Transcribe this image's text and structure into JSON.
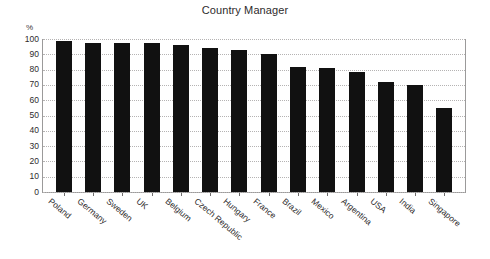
{
  "chart_data": {
    "type": "bar",
    "title": "Country Manager",
    "xlabel": "",
    "ylabel": "%",
    "ylim": [
      0,
      100
    ],
    "ytick_step": 10,
    "grid": true,
    "legend": null,
    "bar_color": "#111111",
    "categories": [
      "Poland",
      "Germany",
      "Sweden",
      "UK",
      "Belgium",
      "Czech Republic",
      "Hungary",
      "France",
      "Brazil",
      "Mexico",
      "Argentina",
      "USA",
      "India",
      "Singapore"
    ],
    "values": [
      98.5,
      97.5,
      97.5,
      97.5,
      96,
      94,
      93,
      90.5,
      82,
      81,
      78.5,
      72,
      70,
      55
    ],
    "ytick_labels": [
      "100",
      "90",
      "80",
      "70",
      "60",
      "50",
      "40",
      "30",
      "20",
      "10",
      "0"
    ],
    "ytick_values": [
      100,
      90,
      80,
      70,
      60,
      50,
      40,
      30,
      20,
      10,
      0
    ]
  }
}
